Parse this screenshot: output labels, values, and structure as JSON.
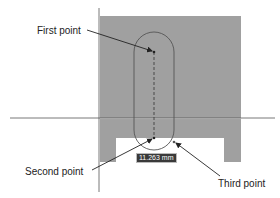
{
  "colors": {
    "block_fill": "#a0a0a0",
    "axis_line": "#555555",
    "slot_outline": "#555555",
    "leader": "#222222",
    "label_text": "#222222",
    "dim_bg": "#3a3a3a",
    "dim_text": "#ffffff",
    "background": "#ffffff"
  },
  "annotations": {
    "first_point": "First point",
    "second_point": "Second point",
    "third_point": "Third point"
  },
  "dimension": {
    "value": "11.263 mm"
  }
}
